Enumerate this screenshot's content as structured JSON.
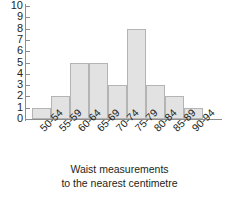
{
  "chart_data": {
    "type": "bar",
    "title": "",
    "subtitle": "",
    "xlabel": "Waist measurements to the nearest centimetre",
    "ylabel": "",
    "categories": [
      "50-54",
      "55-59",
      "60-64",
      "65-69",
      "70-74",
      "75-79",
      "80-84",
      "85-89",
      "90-94"
    ],
    "values": [
      1,
      2,
      5,
      5,
      3,
      8,
      3,
      2,
      1
    ],
    "ylim": [
      0,
      10
    ],
    "y_ticks": [
      0,
      1,
      2,
      3,
      4,
      5,
      6,
      7,
      8,
      9,
      10
    ],
    "y_tick_labels": [
      "0",
      "1",
      "2",
      "3",
      "4",
      "5",
      "6",
      "7",
      "8",
      "9",
      "10"
    ],
    "grid": false,
    "legend": null,
    "bar_fill": "#e2e2e2",
    "bar_stroke": "#b4b4b4",
    "axis_color": "#8d8d8d",
    "text_color": "#231f20"
  },
  "caption": {
    "line1": "Waist measurements",
    "line2": "to the nearest centimetre"
  }
}
